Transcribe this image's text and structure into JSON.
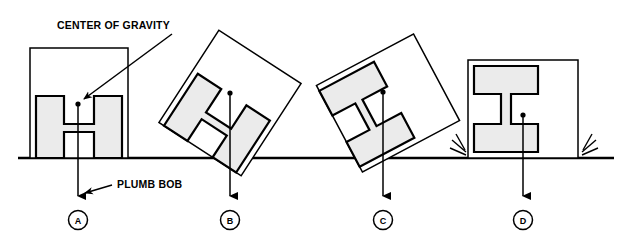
{
  "diagram": {
    "title_annotation": "CENTER OF GRAVITY",
    "plumb_annotation": "PLUMB BOB",
    "colors": {
      "line": "#000000",
      "beam_fill": "#ebebeb",
      "background": "#ffffff",
      "ground": "#000000"
    },
    "ground": {
      "label": "ground-line",
      "y": 158
    },
    "figures": [
      {
        "id": "A",
        "label": "A",
        "circle_cx": 78,
        "circle_cy": 220,
        "state": "upright-stable",
        "rotation_deg": 0,
        "cg_x": 78,
        "cg_y": 104,
        "plumb_inside_base": true,
        "impact_lines": false
      },
      {
        "id": "B",
        "label": "B",
        "circle_cx": 230,
        "circle_cy": 220,
        "state": "tilted-balancing",
        "rotation_deg": 33,
        "cg_x": 230,
        "cg_y": 93,
        "plumb_inside_base": true,
        "impact_lines": false
      },
      {
        "id": "C",
        "label": "C",
        "circle_cx": 383,
        "circle_cy": 220,
        "state": "tipping-past-pivot",
        "rotation_deg": 62,
        "cg_x": 383,
        "cg_y": 92,
        "plumb_inside_base": false,
        "impact_lines": false
      },
      {
        "id": "D",
        "label": "D",
        "circle_cx": 523,
        "circle_cy": 220,
        "state": "fallen-flat",
        "rotation_deg": 90,
        "cg_x": 523,
        "cg_y": 115,
        "plumb_inside_base": true,
        "impact_lines": true
      }
    ]
  }
}
